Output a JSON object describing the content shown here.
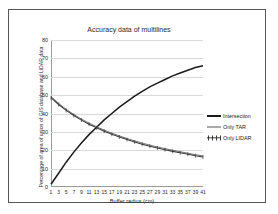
{
  "chart_data": {
    "type": "line",
    "title": "Accuracy data of multilines",
    "xlabel": "Buffer radius (cm)",
    "ylabel": "Percentage of area of union of GIS database and LiDAR data",
    "xlim": [
      1,
      41
    ],
    "ylim": [
      0,
      80
    ],
    "grid": true,
    "legend_position": "right",
    "x": [
      1,
      3,
      5,
      7,
      9,
      11,
      13,
      15,
      17,
      19,
      21,
      23,
      25,
      27,
      29,
      31,
      33,
      35,
      37,
      39,
      41
    ],
    "xticklabels": [
      "1",
      "3",
      "5",
      "7",
      "9",
      "11",
      "13",
      "15",
      "17",
      "19",
      "21",
      "23",
      "25",
      "27",
      "29",
      "31",
      "33",
      "35",
      "37",
      "39",
      "41"
    ],
    "yticklabels": [
      "0",
      "10",
      "20",
      "30",
      "40",
      "50",
      "60",
      "70",
      "80"
    ],
    "yticks": [
      0,
      10,
      20,
      30,
      40,
      50,
      60,
      70,
      80
    ],
    "series": [
      {
        "name": "Intersection",
        "style": "thick-line",
        "color": "#1a1a1a",
        "values": [
          1.5,
          7.5,
          13.5,
          19.0,
          24.0,
          28.5,
          32.5,
          36.5,
          40.0,
          43.5,
          46.5,
          49.5,
          52.0,
          54.5,
          56.5,
          58.5,
          60.5,
          62.0,
          63.5,
          65.0,
          66.0
        ]
      },
      {
        "name": "Only TAR",
        "style": "thin-line",
        "color": "#555555",
        "values": [
          49.2,
          45.5,
          42.3,
          39.5,
          37.0,
          34.8,
          32.8,
          31.0,
          29.3,
          27.8,
          26.4,
          25.1,
          23.9,
          22.8,
          21.8,
          20.9,
          20.0,
          19.2,
          18.4,
          17.6,
          16.9
        ]
      },
      {
        "name": "Only LIDAR",
        "style": "line-with-markers",
        "color": "#3a3a3a",
        "values": [
          48.6,
          44.9,
          41.7,
          38.9,
          36.4,
          34.2,
          32.2,
          30.4,
          28.7,
          27.2,
          25.8,
          24.5,
          23.3,
          22.2,
          21.2,
          20.3,
          19.4,
          18.6,
          17.8,
          17.0,
          16.3
        ]
      }
    ]
  },
  "legend": {
    "items": [
      {
        "label": "Intersection"
      },
      {
        "label": "Only TAR"
      },
      {
        "label": "Only LIDAR"
      }
    ]
  }
}
